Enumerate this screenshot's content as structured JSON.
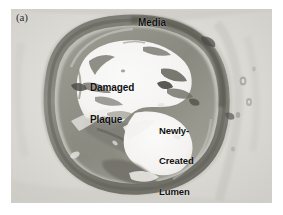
{
  "figure": {
    "panel_label": "(a)",
    "kind": "histology-micrograph",
    "stain_tone_light": "#f2f1ee",
    "stain_tone_mid": "#b8b7b0",
    "stain_tone_dark": "#6e6d66",
    "background": "#ffffff"
  },
  "annotations": {
    "media": "Media",
    "damaged_plaque_line1": "Damaged",
    "damaged_plaque_line2": "Plaque",
    "newly_created_lumen_line1": "Newly-",
    "newly_created_lumen_line2": "Created",
    "newly_created_lumen_line3": "Lumen"
  }
}
